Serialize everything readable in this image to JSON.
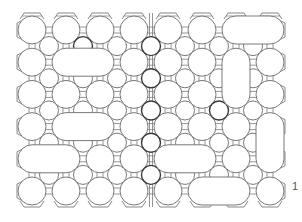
{
  "figure": {
    "type": "patent-line-drawing",
    "reference_numeral": "1",
    "stroke_color": "#7a7a7a",
    "stroke_dark": "#3a3a3a",
    "background": "#ffffff",
    "grid": {
      "large_cols": 8,
      "large_rows": 6,
      "origin_x": 32,
      "origin_y": 30,
      "pitch_x": 34,
      "pitch_y": 32.2,
      "large_radius": 14,
      "small_radius": 9.5
    },
    "seam_x": 151,
    "plate_bounds": {
      "left": 17,
      "top": 13,
      "right": 285,
      "bottom": 207
    },
    "slots": [
      {
        "orientation": "h",
        "row": 1,
        "col_from": 1,
        "col_to": 2
      },
      {
        "orientation": "h",
        "row": 0,
        "col_from": 6,
        "col_to": 7
      },
      {
        "orientation": "v",
        "col": 6,
        "row_from": 1,
        "row_to": 2
      },
      {
        "orientation": "h",
        "row": 3,
        "col_from": 1,
        "col_to": 2
      },
      {
        "orientation": "h",
        "row": 4,
        "col_from": 0,
        "col_to": 1
      },
      {
        "orientation": "h",
        "row": 4,
        "col_from": 4,
        "col_to": 5
      },
      {
        "orientation": "h",
        "row": 5,
        "col_from": 5,
        "col_to": 6
      },
      {
        "orientation": "v",
        "col": 7,
        "row_from": 3,
        "row_to": 4
      }
    ],
    "dark_small_holes": [
      [
        3,
        0
      ],
      [
        3,
        1
      ],
      [
        3,
        2
      ],
      [
        3,
        3
      ],
      [
        3,
        4
      ],
      [
        1,
        0
      ],
      [
        5,
        2
      ]
    ]
  }
}
